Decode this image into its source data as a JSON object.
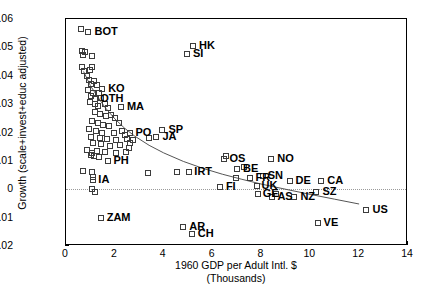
{
  "chart_data": {
    "type": "scatter",
    "title": "",
    "xlabel": "1960 GDP per Adult Intl. $",
    "xlabel_line2": "(Thousands)",
    "ylabel": "Growth (scale+invest+educ adjusted)",
    "xlim": [
      0,
      14
    ],
    "ylim": [
      -0.02,
      0.06
    ],
    "xticks": [
      0,
      2,
      4,
      6,
      8,
      10,
      12,
      14
    ],
    "xtick_labels": [
      "0",
      "2",
      "4",
      "6",
      "8",
      "10",
      "12",
      "14"
    ],
    "yticks": [
      -0.02,
      -0.01,
      0,
      0.01,
      0.02,
      0.03,
      0.04,
      0.05,
      0.06
    ],
    "ytick_labels": [
      "-0.02",
      "-0.01",
      "0",
      "0.01",
      "0.02",
      "0.03",
      "0.04",
      "0.05",
      "0.06"
    ],
    "grid": false,
    "legend": "none",
    "zero_reference_line": 0,
    "marker": "open-square",
    "trend_line": {
      "description": "downward-sloping fitted curve",
      "points": [
        [
          0.72,
          0.0415
        ],
        [
          1.0,
          0.0365
        ],
        [
          1.3,
          0.0325
        ],
        [
          1.6,
          0.0288
        ],
        [
          2.0,
          0.0248
        ],
        [
          2.4,
          0.0215
        ],
        [
          2.8,
          0.0188
        ],
        [
          3.4,
          0.0155
        ],
        [
          4.0,
          0.0128
        ],
        [
          4.8,
          0.0098
        ],
        [
          5.6,
          0.0074
        ],
        [
          6.4,
          0.0053
        ],
        [
          7.2,
          0.0035
        ],
        [
          8.0,
          0.0018
        ],
        [
          9.0,
          0.0
        ],
        [
          10.0,
          -0.0018
        ],
        [
          11.0,
          -0.0035
        ],
        [
          12.0,
          -0.0052
        ]
      ]
    },
    "labeled_points": [
      {
        "label": "BOT",
        "x": 0.92,
        "y": 0.0555,
        "lx": 6,
        "ly": -6
      },
      {
        "label": "HK",
        "x": 5.2,
        "y": 0.0505,
        "lx": 6,
        "ly": -6
      },
      {
        "label": "SI",
        "x": 4.95,
        "y": 0.0478,
        "lx": 6,
        "ly": -6
      },
      {
        "label": "KO",
        "x": 1.48,
        "y": 0.0355,
        "lx": 6,
        "ly": -6
      },
      {
        "label": "OTH",
        "x": 1.2,
        "y": 0.0318,
        "lx": 5,
        "ly": -6
      },
      {
        "label": "MA",
        "x": 2.25,
        "y": 0.029,
        "lx": 6,
        "ly": -6
      },
      {
        "label": "PO",
        "x": 2.6,
        "y": 0.02,
        "lx": 6,
        "ly": -6
      },
      {
        "label": "SP",
        "x": 3.95,
        "y": 0.0208,
        "lx": 6,
        "ly": -6
      },
      {
        "label": "JA",
        "x": 3.7,
        "y": 0.0185,
        "lx": 6,
        "ly": -6
      },
      {
        "label": "PH",
        "x": 1.7,
        "y": 0.0098,
        "lx": 6,
        "ly": -6
      },
      {
        "label": "IA",
        "x": 1.12,
        "y": 0.0032,
        "lx": 5,
        "ly": -6
      },
      {
        "label": "ZAM",
        "x": 1.42,
        "y": -0.01,
        "lx": 6,
        "ly": -6
      },
      {
        "label": "IRT",
        "x": 5.05,
        "y": 0.0062,
        "lx": 5,
        "ly": -6
      },
      {
        "label": "OS",
        "x": 6.45,
        "y": 0.0105,
        "lx": 6,
        "ly": -6
      },
      {
        "label": "NO",
        "x": 8.4,
        "y": 0.0108,
        "lx": 6,
        "ly": -6
      },
      {
        "label": "BE",
        "x": 7.0,
        "y": 0.007,
        "lx": 6,
        "ly": -6
      },
      {
        "label": "FR",
        "x": 7.55,
        "y": 0.004,
        "lx": 5,
        "ly": -6
      },
      {
        "label": "SN",
        "x": 8.05,
        "y": 0.0046,
        "lx": 5,
        "ly": -6
      },
      {
        "label": "DE",
        "x": 9.15,
        "y": 0.0028,
        "lx": 6,
        "ly": -6
      },
      {
        "label": "CA",
        "x": 10.45,
        "y": 0.0028,
        "lx": 6,
        "ly": -6
      },
      {
        "label": "FI",
        "x": 6.3,
        "y": 0.0008,
        "lx": 6,
        "ly": -6
      },
      {
        "label": "UK",
        "x": 7.8,
        "y": 0.0012,
        "lx": 5,
        "ly": -6
      },
      {
        "label": "GE",
        "x": 7.85,
        "y": -0.0018,
        "lx": 5,
        "ly": -6
      },
      {
        "label": "AS",
        "x": 8.45,
        "y": -0.0028,
        "lx": 5,
        "ly": -6
      },
      {
        "label": "NZ",
        "x": 9.35,
        "y": -0.0028,
        "lx": 6,
        "ly": -6
      },
      {
        "label": "SZ",
        "x": 10.25,
        "y": -0.001,
        "lx": 6,
        "ly": -6
      },
      {
        "label": "US",
        "x": 12.3,
        "y": -0.0072,
        "lx": 6,
        "ly": -6
      },
      {
        "label": "VE",
        "x": 10.3,
        "y": -0.0118,
        "lx": 6,
        "ly": -6
      },
      {
        "label": "AR",
        "x": 4.8,
        "y": -0.0132,
        "lx": 6,
        "ly": -6
      },
      {
        "label": "CH",
        "x": 5.15,
        "y": -0.0158,
        "lx": 6,
        "ly": -6
      }
    ],
    "unlabeled_points": [
      {
        "x": 0.62,
        "y": 0.0565
      },
      {
        "x": 0.66,
        "y": 0.0488
      },
      {
        "x": 0.78,
        "y": 0.0482
      },
      {
        "x": 0.7,
        "y": 0.0472
      },
      {
        "x": 1.05,
        "y": 0.047
      },
      {
        "x": 0.66,
        "y": 0.0432
      },
      {
        "x": 0.74,
        "y": 0.0415
      },
      {
        "x": 0.98,
        "y": 0.042
      },
      {
        "x": 1.08,
        "y": 0.0432
      },
      {
        "x": 0.88,
        "y": 0.0398
      },
      {
        "x": 0.96,
        "y": 0.0385
      },
      {
        "x": 1.02,
        "y": 0.0372
      },
      {
        "x": 1.14,
        "y": 0.0382
      },
      {
        "x": 1.26,
        "y": 0.0368
      },
      {
        "x": 0.92,
        "y": 0.035
      },
      {
        "x": 1.1,
        "y": 0.034
      },
      {
        "x": 1.02,
        "y": 0.033
      },
      {
        "x": 1.34,
        "y": 0.0338
      },
      {
        "x": 1.44,
        "y": 0.0322
      },
      {
        "x": 0.98,
        "y": 0.0308
      },
      {
        "x": 1.18,
        "y": 0.03
      },
      {
        "x": 1.3,
        "y": 0.0292
      },
      {
        "x": 1.58,
        "y": 0.03
      },
      {
        "x": 1.72,
        "y": 0.0288
      },
      {
        "x": 1.2,
        "y": 0.0272
      },
      {
        "x": 1.4,
        "y": 0.0265
      },
      {
        "x": 1.62,
        "y": 0.0258
      },
      {
        "x": 1.85,
        "y": 0.0262
      },
      {
        "x": 2.02,
        "y": 0.025
      },
      {
        "x": 1.05,
        "y": 0.024
      },
      {
        "x": 1.3,
        "y": 0.0232
      },
      {
        "x": 1.52,
        "y": 0.0228
      },
      {
        "x": 1.76,
        "y": 0.0222
      },
      {
        "x": 2.15,
        "y": 0.0232
      },
      {
        "x": 0.95,
        "y": 0.0212
      },
      {
        "x": 1.22,
        "y": 0.0205
      },
      {
        "x": 1.48,
        "y": 0.02
      },
      {
        "x": 1.95,
        "y": 0.0198
      },
      {
        "x": 2.3,
        "y": 0.0205
      },
      {
        "x": 2.42,
        "y": 0.0192
      },
      {
        "x": 1.02,
        "y": 0.0185
      },
      {
        "x": 1.38,
        "y": 0.0182
      },
      {
        "x": 1.68,
        "y": 0.0178
      },
      {
        "x": 2.05,
        "y": 0.0172
      },
      {
        "x": 2.5,
        "y": 0.0178
      },
      {
        "x": 3.4,
        "y": 0.018
      },
      {
        "x": 1.1,
        "y": 0.0162
      },
      {
        "x": 1.45,
        "y": 0.0158
      },
      {
        "x": 1.8,
        "y": 0.0152
      },
      {
        "x": 2.22,
        "y": 0.0155
      },
      {
        "x": 2.62,
        "y": 0.0162
      },
      {
        "x": 2.75,
        "y": 0.0175
      },
      {
        "x": 0.88,
        "y": 0.014
      },
      {
        "x": 1.28,
        "y": 0.0135
      },
      {
        "x": 1.58,
        "y": 0.0132
      },
      {
        "x": 2.05,
        "y": 0.0128
      },
      {
        "x": 2.45,
        "y": 0.0132
      },
      {
        "x": 2.58,
        "y": 0.0145
      },
      {
        "x": 1.04,
        "y": 0.0122
      },
      {
        "x": 1.15,
        "y": 0.0118
      },
      {
        "x": 1.35,
        "y": 0.0112
      },
      {
        "x": 1.05,
        "y": 0.0128
      },
      {
        "x": 6.55,
        "y": 0.0118
      },
      {
        "x": 0.7,
        "y": 0.0065
      },
      {
        "x": 1.08,
        "y": 0.0062
      },
      {
        "x": 3.35,
        "y": 0.0058
      },
      {
        "x": 4.55,
        "y": 0.0062
      },
      {
        "x": 7.3,
        "y": 0.0078
      },
      {
        "x": 1.1,
        "y": 0.0042
      },
      {
        "x": 1.05,
        "y": 0.0002
      },
      {
        "x": 1.18,
        "y": -0.0008
      },
      {
        "x": 6.95,
        "y": 0.0038
      },
      {
        "x": 8.6,
        "y": -0.0018
      }
    ]
  }
}
